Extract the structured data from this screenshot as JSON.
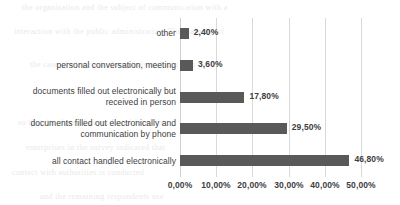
{
  "chart_data": {
    "type": "bar",
    "orientation": "horizontal",
    "title": "",
    "xlabel": "",
    "ylabel": "",
    "categories": [
      "other",
      "personal conversation, meeting",
      "documents filled out electronically but\nreceived in person",
      "documents filled out electronically and\ncommunication by phone",
      "all contact handled electronically"
    ],
    "values": [
      2.4,
      3.6,
      17.8,
      29.5,
      46.8
    ],
    "value_labels": [
      "2,40%",
      "3,60%",
      "17,80%",
      "29,50%",
      "46,80%"
    ],
    "xlim": [
      0,
      50
    ],
    "xticks": [
      0,
      10,
      20,
      30,
      40,
      50
    ],
    "xtick_labels": [
      "0,00%",
      "10,00%",
      "20,00%",
      "30,00%",
      "40,00%",
      "50,00%"
    ],
    "grid": "vertical",
    "legend": "none",
    "decimal_separator": ",",
    "colors": {
      "bar": "#595959",
      "gridline": "#d9d9d9",
      "text": "#404040",
      "background": "#ffffff"
    }
  },
  "bleed_text": {
    "lines": [
      "the organisation and the subject of communication with a",
      "interaction with the public administration. The majority of",
      "the case of electronic documents and it is also",
      "so that the share of paper-based forms is",
      "enterprises in the survey indicated that",
      "contact with authorities is conducted",
      "and the remaining respondents use"
    ]
  }
}
